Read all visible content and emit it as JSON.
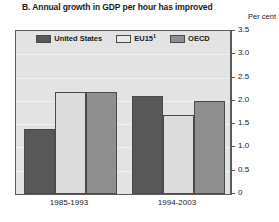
{
  "chart_data": {
    "type": "bar",
    "title": "B. Annual growth in GDP per hour has improved",
    "xlabel": "",
    "ylabel": "Per cent",
    "ylim": [
      0,
      3.5
    ],
    "ytick_labels": [
      "3.5",
      "3.0",
      "2.5",
      "2.0",
      "1.5",
      "1.0",
      "0.5",
      "0"
    ],
    "ytick_values": [
      3.5,
      3.0,
      2.5,
      2.0,
      1.5,
      1.0,
      0.5,
      0
    ],
    "grid": true,
    "legend_position": "top-inside",
    "categories": [
      "1985-1993",
      "1994-2003"
    ],
    "series": [
      {
        "name": "United States",
        "color": "#585858",
        "values": [
          1.4,
          2.1
        ]
      },
      {
        "name": "EU15",
        "footnote": "1",
        "color": "#dcdcdc",
        "values": [
          2.2,
          1.7
        ]
      },
      {
        "name": "OECD",
        "color": "#8f8f8f",
        "values": [
          2.2,
          2.0
        ]
      }
    ]
  },
  "legend": {
    "items": [
      {
        "label": "United States"
      },
      {
        "label": "EU15",
        "footnote": "1"
      },
      {
        "label": "OECD"
      }
    ]
  },
  "axis": {
    "unit_label": "Per cent"
  }
}
